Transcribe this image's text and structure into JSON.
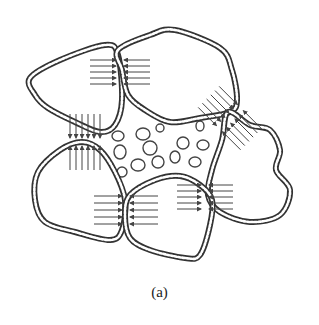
{
  "caption": "(a)",
  "colors": {
    "outline": "#333333",
    "bead": "#ffffff",
    "arrow": "#444444",
    "pore": "#444444",
    "background": "#ffffff"
  },
  "particles": [
    {
      "id": "top-left",
      "points": [
        [
          30,
          78
        ],
        [
          60,
          60
        ],
        [
          105,
          45
        ],
        [
          118,
          55
        ],
        [
          122,
          100
        ],
        [
          115,
          125
        ],
        [
          100,
          132
        ],
        [
          75,
          122
        ],
        [
          48,
          108
        ],
        [
          35,
          95
        ]
      ]
    },
    {
      "id": "top-right",
      "points": [
        [
          118,
          50
        ],
        [
          150,
          35
        ],
        [
          175,
          30
        ],
        [
          220,
          48
        ],
        [
          232,
          70
        ],
        [
          237,
          100
        ],
        [
          230,
          112
        ],
        [
          200,
          118
        ],
        [
          170,
          122
        ],
        [
          145,
          110
        ],
        [
          128,
          95
        ],
        [
          122,
          70
        ]
      ]
    },
    {
      "id": "right",
      "points": [
        [
          228,
          112
        ],
        [
          250,
          125
        ],
        [
          270,
          130
        ],
        [
          280,
          150
        ],
        [
          276,
          170
        ],
        [
          290,
          190
        ],
        [
          280,
          215
        ],
        [
          250,
          222
        ],
        [
          220,
          212
        ],
        [
          208,
          195
        ],
        [
          212,
          170
        ],
        [
          222,
          140
        ]
      ]
    },
    {
      "id": "bottom-left",
      "points": [
        [
          38,
          172
        ],
        [
          60,
          150
        ],
        [
          82,
          142
        ],
        [
          100,
          150
        ],
        [
          115,
          172
        ],
        [
          125,
          200
        ],
        [
          122,
          230
        ],
        [
          110,
          240
        ],
        [
          75,
          232
        ],
        [
          45,
          222
        ],
        [
          35,
          200
        ]
      ]
    },
    {
      "id": "bottom-middle",
      "points": [
        [
          130,
          195
        ],
        [
          155,
          180
        ],
        [
          180,
          176
        ],
        [
          200,
          185
        ],
        [
          212,
          200
        ],
        [
          210,
          225
        ],
        [
          200,
          255
        ],
        [
          185,
          258
        ],
        [
          150,
          250
        ],
        [
          130,
          238
        ],
        [
          125,
          215
        ]
      ]
    }
  ],
  "contacts": [
    {
      "id": "c1",
      "x": 120,
      "y": 72,
      "dir": "horizontal",
      "rows": [
        60,
        66,
        72,
        78,
        84
      ],
      "len": 26
    },
    {
      "id": "c2",
      "x": 82,
      "y": 142,
      "dir": "vertical",
      "cols": [
        70,
        76,
        82,
        88,
        94,
        100
      ],
      "len": 24
    },
    {
      "id": "c3",
      "x": 232,
      "y": 116,
      "dir": "diag",
      "count": 6,
      "len": 26
    },
    {
      "id": "c4",
      "x": 126,
      "y": 210,
      "dir": "horizontal",
      "rows": [
        196,
        203,
        210,
        217,
        224
      ],
      "len": 28
    },
    {
      "id": "c5",
      "x": 205,
      "y": 200,
      "dir": "horizontal",
      "rows": [
        185,
        191,
        197,
        203,
        209
      ],
      "len": 24
    }
  ],
  "pores": [
    [
      118,
      136,
      6,
      5
    ],
    [
      143,
      134,
      7,
      6
    ],
    [
      160,
      128,
      4,
      4
    ],
    [
      200,
      126,
      4,
      5
    ],
    [
      120,
      152,
      6,
      7
    ],
    [
      150,
      148,
      7,
      7
    ],
    [
      183,
      143,
      6,
      6
    ],
    [
      203,
      145,
      6,
      5
    ],
    [
      122,
      172,
      5,
      5
    ],
    [
      138,
      165,
      7,
      6
    ],
    [
      158,
      162,
      6,
      6
    ],
    [
      175,
      157,
      5,
      6
    ],
    [
      195,
      162,
      6,
      5
    ]
  ]
}
